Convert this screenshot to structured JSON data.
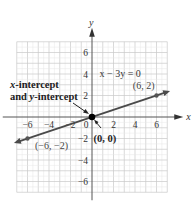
{
  "chart_data": {
    "type": "line",
    "title": "",
    "xlabel": "x",
    "ylabel": "y",
    "xlim": [
      -7,
      7
    ],
    "ylim": [
      -7,
      7
    ],
    "grid": true,
    "x_ticks": [
      -6,
      -4,
      -2,
      0,
      2,
      4,
      6
    ],
    "y_ticks": [
      -6,
      -4,
      -2,
      2,
      4,
      6
    ],
    "series": [
      {
        "name": "x - 3y = 0",
        "equation": "x − 3y = 0",
        "slope": 0.3333,
        "intercept": 0,
        "x_range": [
          -7,
          7
        ],
        "color": "#4a4a4a"
      }
    ],
    "points": [
      {
        "x": 6,
        "y": 2,
        "label": "(6, 2)"
      },
      {
        "x": -6,
        "y": -2,
        "label": "(−6, −2)"
      },
      {
        "x": 0,
        "y": 0,
        "label": "(0, 0)",
        "emphasis": true
      }
    ],
    "annotations": [
      {
        "text_line1_var": "x",
        "text_line1_rest": "-intercept",
        "text_line2_pre": "and ",
        "text_line2_var": "y",
        "text_line2_rest": "-intercept",
        "points_to": [
          0,
          0
        ]
      }
    ]
  }
}
